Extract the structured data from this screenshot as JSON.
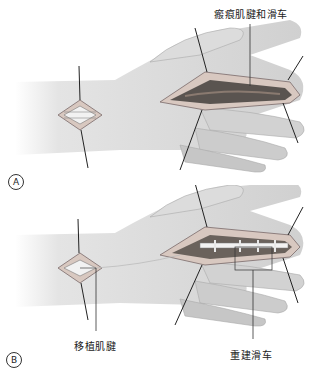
{
  "figure": {
    "panels": [
      {
        "id": "A",
        "badge": "A",
        "labels": {
          "scarred_tendon": "瘢痕肌腱和滑车"
        }
      },
      {
        "id": "B",
        "badge": "B",
        "labels": {
          "graft_tendon": "移植肌腱",
          "reconstructed_pulley": "重建滑车"
        }
      }
    ]
  },
  "colors": {
    "skin_light": "#e6e6e6",
    "skin_mid": "#c8c8c8",
    "skin_dark": "#9a9a9a",
    "incision_edge": "#7a6a6a",
    "scar_tissue": "#5a5450",
    "tendon": "#f2f2f2",
    "retractor_line": "#222222"
  }
}
